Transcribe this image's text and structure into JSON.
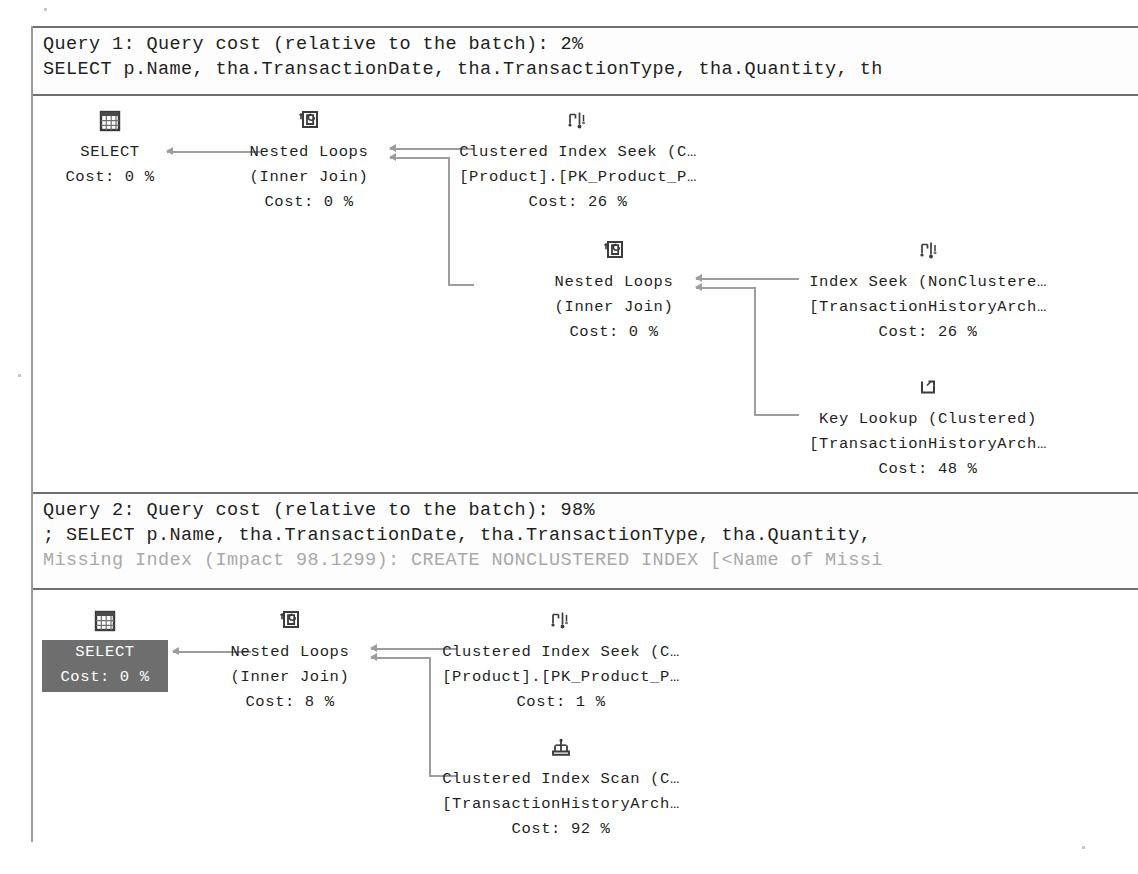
{
  "window": {
    "title": "Execution plan",
    "background": "#ffffff",
    "border_color": "#9a9a9a",
    "selection_color": "#6e6e6e",
    "connector_color": "#9d9d9d"
  },
  "plans": [
    {
      "id": "query-1",
      "header": {
        "cost_line": "Query 1: Query cost (relative to the batch): 2%",
        "sql_line": "SELECT p.Name, tha.TransactionDate, tha.TransactionType, tha.Quantity, th",
        "missing_index_line": ""
      },
      "nodes": [
        {
          "id": "select-1",
          "icon": "select-result-grid-icon",
          "lines": [
            "SELECT",
            "Cost: 0 %"
          ],
          "selected": false
        },
        {
          "id": "nested-loops-1",
          "icon": "nested-loops-icon",
          "lines": [
            "Nested Loops",
            "(Inner Join)",
            "Cost: 0 %"
          ],
          "selected": false
        },
        {
          "id": "clustered-index-seek-1",
          "icon": "index-seek-icon",
          "lines": [
            "Clustered Index Seek (C…",
            "[Product].[PK_Product_P…",
            "Cost: 26 %"
          ],
          "selected": false
        },
        {
          "id": "nested-loops-2",
          "icon": "nested-loops-icon",
          "lines": [
            "Nested Loops",
            "(Inner Join)",
            "Cost: 0 %"
          ],
          "selected": false
        },
        {
          "id": "index-seek-1",
          "icon": "index-seek-icon",
          "lines": [
            "Index Seek (NonClustere…",
            "[TransactionHistoryArch…",
            "Cost: 26 %"
          ],
          "selected": false
        },
        {
          "id": "key-lookup-1",
          "icon": "key-lookup-icon",
          "lines": [
            "Key Lookup (Clustered)",
            "[TransactionHistoryArch…",
            "Cost: 48 %"
          ],
          "selected": false
        }
      ]
    },
    {
      "id": "query-2",
      "header": {
        "cost_line": "Query 2: Query cost (relative to the batch): 98%",
        "sql_line": "; SELECT p.Name, tha.TransactionDate, tha.TransactionType, tha.Quantity,",
        "missing_index_line": "Missing Index (Impact 98.1299): CREATE NONCLUSTERED INDEX [<Name of Missi"
      },
      "nodes": [
        {
          "id": "select-2",
          "icon": "select-result-grid-icon",
          "lines": [
            "SELECT",
            "Cost: 0 %"
          ],
          "selected": true
        },
        {
          "id": "nested-loops-3",
          "icon": "nested-loops-icon",
          "lines": [
            "Nested Loops",
            "(Inner Join)",
            "Cost: 8 %"
          ],
          "selected": false
        },
        {
          "id": "clustered-index-seek-2",
          "icon": "index-seek-icon",
          "lines": [
            "Clustered Index Seek (C…",
            "[Product].[PK_Product_P…",
            "Cost: 1 %"
          ],
          "selected": false
        },
        {
          "id": "clustered-index-scan-1",
          "icon": "index-scan-icon",
          "lines": [
            "Clustered Index Scan (C…",
            "[TransactionHistoryArch…",
            "Cost: 92 %"
          ],
          "selected": false
        }
      ]
    }
  ]
}
